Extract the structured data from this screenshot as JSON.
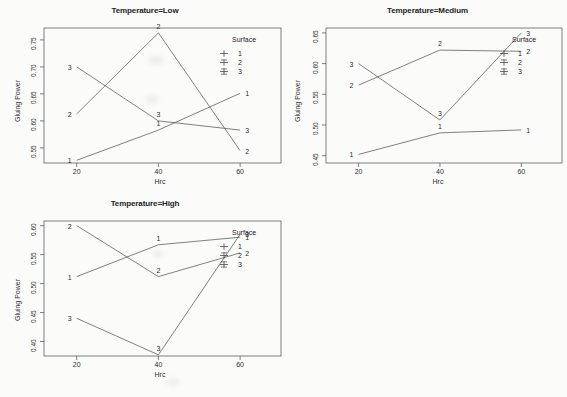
{
  "figure": {
    "panels": [
      {
        "id": "low",
        "title": "Temperature=Low",
        "xlabel": "Hrc",
        "ylabel": "Gluing Power",
        "xticks": [
          "20",
          "40",
          "60"
        ],
        "yticks": [
          "0.55",
          "0.60",
          "0.65",
          "0.70",
          "0.75"
        ],
        "legend": {
          "title": "Surface",
          "items": [
            "1",
            "2",
            "3"
          ]
        }
      },
      {
        "id": "medium",
        "title": "Temperature=Medium",
        "xlabel": "Hrc",
        "ylabel": "Gluing Power",
        "xticks": [
          "20",
          "40",
          "60"
        ],
        "yticks": [
          "0.45",
          "0.50",
          "0.55",
          "0.60",
          "0.65"
        ],
        "legend": {
          "title": "Surface",
          "items": [
            "1",
            "2",
            "3"
          ]
        }
      },
      {
        "id": "high",
        "title": "Temperature=High",
        "xlabel": "Hrc",
        "ylabel": "Gluing Power",
        "xticks": [
          "20",
          "40",
          "60"
        ],
        "yticks": [
          "0.40",
          "0.45",
          "0.50",
          "0.55",
          "0.60"
        ],
        "legend": {
          "title": "Surface",
          "items": [
            "1",
            "2",
            "3"
          ]
        }
      }
    ]
  },
  "chart_data": [
    {
      "type": "line",
      "title": "Temperature=Low",
      "xlabel": "Hrc",
      "ylabel": "Gluing Power",
      "x": [
        20,
        40,
        60
      ],
      "xlim": [
        12,
        70
      ],
      "ylim": [
        0.522,
        0.772
      ],
      "xticks": [
        20,
        40,
        60
      ],
      "yticks": [
        0.55,
        0.6,
        0.65,
        0.7,
        0.75
      ],
      "grid": false,
      "legend": "Surface",
      "legend_position": "top-right-inside",
      "series": [
        {
          "name": "1",
          "values": [
            0.527,
            0.583,
            0.651
          ]
        },
        {
          "name": "2",
          "values": [
            0.613,
            0.763,
            0.545
          ]
        },
        {
          "name": "3",
          "values": [
            0.7,
            0.6,
            0.583
          ]
        }
      ]
    },
    {
      "type": "line",
      "title": "Temperature=Medium",
      "xlabel": "Hrc",
      "ylabel": "Gluing Power",
      "x": [
        20,
        40,
        60
      ],
      "xlim": [
        12,
        70
      ],
      "ylim": [
        0.438,
        0.658
      ],
      "xticks": [
        20,
        40,
        60
      ],
      "yticks": [
        0.45,
        0.5,
        0.55,
        0.6,
        0.65
      ],
      "grid": false,
      "legend": "Surface",
      "legend_position": "top-right-inside",
      "series": [
        {
          "name": "1",
          "values": [
            0.452,
            0.487,
            0.492
          ]
        },
        {
          "name": "2",
          "values": [
            0.565,
            0.622,
            0.62
          ]
        },
        {
          "name": "3",
          "values": [
            0.6,
            0.508,
            0.65
          ]
        }
      ]
    },
    {
      "type": "line",
      "title": "Temperature=High",
      "xlabel": "Hrc",
      "ylabel": "Gluing Power",
      "x": [
        20,
        40,
        60
      ],
      "xlim": [
        12,
        70
      ],
      "ylim": [
        0.375,
        0.608
      ],
      "xticks": [
        20,
        40,
        60
      ],
      "yticks": [
        0.4,
        0.45,
        0.5,
        0.55,
        0.6
      ],
      "grid": false,
      "legend": "Surface",
      "legend_position": "top-right-inside",
      "series": [
        {
          "name": "1",
          "values": [
            0.512,
            0.567,
            0.58
          ]
        },
        {
          "name": "2",
          "values": [
            0.6,
            0.512,
            0.553
          ]
        },
        {
          "name": "3",
          "values": [
            0.44,
            0.377,
            0.585
          ]
        }
      ]
    }
  ]
}
